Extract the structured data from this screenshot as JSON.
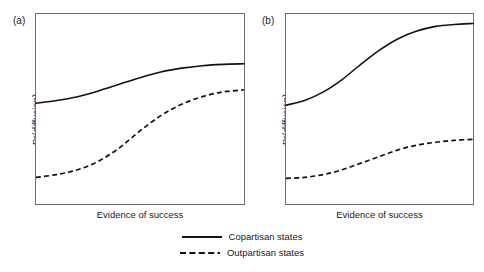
{
  "figure": {
    "background": "#ffffff",
    "line_color": "#121212",
    "frame_color": "#6e6e6e"
  },
  "panels": [
    {
      "tag": "(a)",
      "xlabel": "Evidence of success",
      "ylabel": "Pr(diffusion)"
    },
    {
      "tag": "(b)",
      "xlabel": "Evidence of success",
      "ylabel": "Pr(diffusion)"
    }
  ],
  "legend": {
    "items": [
      {
        "label": "Copartisan states",
        "style": "solid"
      },
      {
        "label": "Outpartisan states",
        "style": "dashed"
      }
    ]
  },
  "chart_data": {
    "type": "line",
    "title": "",
    "xlabel": "Evidence of success",
    "ylabel": "Pr(diffusion)",
    "xlim": [
      0,
      1
    ],
    "ylim": [
      0,
      1
    ],
    "grid": false,
    "axis_ticks": false,
    "legend_position": "bottom-center",
    "panels": [
      {
        "tag": "(a)",
        "x": [
          0,
          0.1,
          0.2,
          0.3,
          0.4,
          0.5,
          0.6,
          0.7,
          0.8,
          0.9,
          1.0
        ],
        "series": [
          {
            "name": "Copartisan states",
            "style": "solid",
            "values": [
              0.53,
              0.545,
              0.565,
              0.595,
              0.63,
              0.665,
              0.695,
              0.715,
              0.728,
              0.735,
              0.738
            ]
          },
          {
            "name": "Outpartisan states",
            "style": "dashed",
            "values": [
              0.14,
              0.155,
              0.18,
              0.225,
              0.295,
              0.385,
              0.465,
              0.525,
              0.565,
              0.59,
              0.6
            ]
          }
        ]
      },
      {
        "tag": "(b)",
        "x": [
          0,
          0.1,
          0.2,
          0.3,
          0.4,
          0.5,
          0.6,
          0.7,
          0.8,
          0.9,
          1.0
        ],
        "series": [
          {
            "name": "Copartisan states",
            "style": "solid",
            "values": [
              0.52,
              0.545,
              0.59,
              0.655,
              0.735,
              0.81,
              0.87,
              0.91,
              0.935,
              0.945,
              0.95
            ]
          },
          {
            "name": "Outpartisan states",
            "style": "dashed",
            "values": [
              0.135,
              0.14,
              0.155,
              0.18,
              0.215,
              0.25,
              0.285,
              0.31,
              0.325,
              0.335,
              0.34
            ]
          }
        ]
      }
    ]
  }
}
